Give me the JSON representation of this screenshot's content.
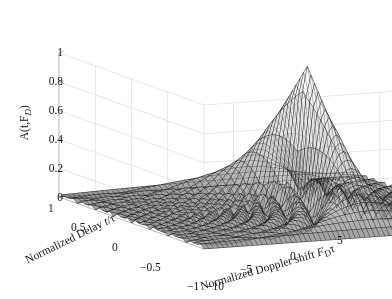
{
  "figure": {
    "background_color": "#ffffff",
    "width": 392,
    "height": 299,
    "mesh_line_color": "#2a2a2a",
    "surface_face_color": "#b4b4b4",
    "grid_color": "#d8d8d8",
    "axis_color": "#b0b0b0",
    "text_color": "#141414"
  },
  "chart_data": {
    "type": "surface",
    "title": "",
    "xlabel": "Normalized Doppler shift F_Dτ",
    "ylabel": "Normalized Delay t/τ",
    "zlabel": "A(t,F_D)",
    "xlim": [
      -12,
      8
    ],
    "ylim": [
      -1,
      1
    ],
    "zlim": [
      0,
      1
    ],
    "xticks": [
      -10,
      -5,
      0,
      5
    ],
    "xticklabels": [
      "−10",
      "−5",
      "0",
      "5"
    ],
    "yticks": [
      1,
      0.5,
      0,
      -0.5,
      -1
    ],
    "yticklabels": [
      "1",
      "0.5",
      "0",
      "−0.5",
      "−1"
    ],
    "zticks": [
      0,
      0.2,
      0.4,
      0.6,
      0.8,
      1
    ],
    "zticklabels": [
      "0",
      "0.2",
      "0.4",
      "0.6",
      "0.8",
      "1"
    ],
    "grid": true,
    "legend": "none",
    "colormap": "gray",
    "function": "abs((1-abs(t))*sinc(F*(1-abs(t))))",
    "x_samples": 61,
    "y_samples": 41,
    "peak_value": 1.0,
    "peak_at": {
      "delay": 0,
      "doppler": 0
    },
    "sidelobe_peaks": [
      {
        "doppler": 1.43,
        "value": 0.217
      },
      {
        "doppler": 2.46,
        "value": 0.128
      },
      {
        "doppler": 3.47,
        "value": 0.091
      },
      {
        "doppler": 4.48,
        "value": 0.071
      },
      {
        "doppler": 5.48,
        "value": 0.058
      }
    ],
    "zero_crossings_doppler": [
      -6,
      -5,
      -4,
      -3,
      -2,
      -1,
      1,
      2,
      3,
      4,
      5,
      6
    ],
    "view": {
      "azimuth": -37.5,
      "elevation": 30
    }
  },
  "z_axis": {
    "label": "A(t,F",
    "label_sub": "D",
    "label_tail": ")",
    "ticks": [
      {
        "value": 1,
        "text": "1"
      },
      {
        "value": 0.8,
        "text": "0.8"
      },
      {
        "value": 0.6,
        "text": "0.6"
      },
      {
        "value": 0.4,
        "text": "0.4"
      },
      {
        "value": 0.2,
        "text": "0.2"
      },
      {
        "value": 0,
        "text": "0"
      }
    ]
  },
  "y_axis": {
    "label_prefix": "Normalized Delay ",
    "label_italic": "t",
    "label_tail": "/τ",
    "ticks": [
      {
        "value": 1,
        "text": "1"
      },
      {
        "value": 0.5,
        "text": "0.5"
      },
      {
        "value": 0,
        "text": "0"
      },
      {
        "value": -0.5,
        "text": "−0.5"
      },
      {
        "value": -1,
        "text": "−1"
      }
    ]
  },
  "x_axis": {
    "label_prefix": "Normalized Doppler shift ",
    "label_italic": "F",
    "label_sub": "D",
    "label_tail": "τ",
    "ticks": [
      {
        "value": -10,
        "text": "−10"
      },
      {
        "value": -5,
        "text": "−5"
      },
      {
        "value": 0,
        "text": "0"
      },
      {
        "value": 5,
        "text": "5"
      }
    ]
  }
}
